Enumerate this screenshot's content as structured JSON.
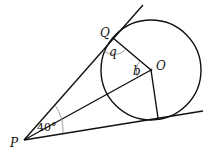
{
  "diagram": {
    "type": "geometry",
    "points": {
      "P": {
        "label": "P",
        "x": 24,
        "y": 140
      },
      "Q": {
        "label": "Q",
        "x": 113,
        "y": 38
      },
      "O": {
        "label": "O",
        "x": 151,
        "y": 70
      },
      "T": {
        "label": "",
        "x": 158,
        "y": 118
      }
    },
    "circle": {
      "cx": 151,
      "cy": 70,
      "r": 50
    },
    "angles": {
      "at_P": {
        "label": "40°"
      },
      "at_Q": {
        "label": "q"
      },
      "at_O": {
        "label": "b"
      }
    },
    "colors": {
      "line": "#111111",
      "arc": "#888888",
      "background": "#ffffff"
    }
  }
}
